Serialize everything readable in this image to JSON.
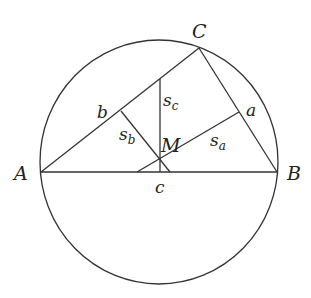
{
  "diagram": {
    "vertices": {
      "A": {
        "label": "A",
        "x": 41,
        "y": 172
      },
      "B": {
        "label": "B",
        "x": 277,
        "y": 172
      },
      "C": {
        "label": "C",
        "x": 199,
        "y": 48
      }
    },
    "point_M": {
      "label": "M",
      "x": 160,
      "y": 158
    },
    "sides": {
      "a": {
        "label": "a"
      },
      "b": {
        "label": "b"
      },
      "c": {
        "label": "c"
      }
    },
    "segments": {
      "s_a": {
        "label_main": "s",
        "label_sub": "a"
      },
      "s_b": {
        "label_main": "s",
        "label_sub": "b"
      },
      "s_c": {
        "label_main": "s",
        "label_sub": "c"
      }
    },
    "circle": {
      "cx": 159,
      "cy": 162,
      "rx": 119,
      "ry": 122
    },
    "colors": {
      "stroke": "#333333",
      "text": "#222222",
      "background": "#ffffff"
    }
  }
}
